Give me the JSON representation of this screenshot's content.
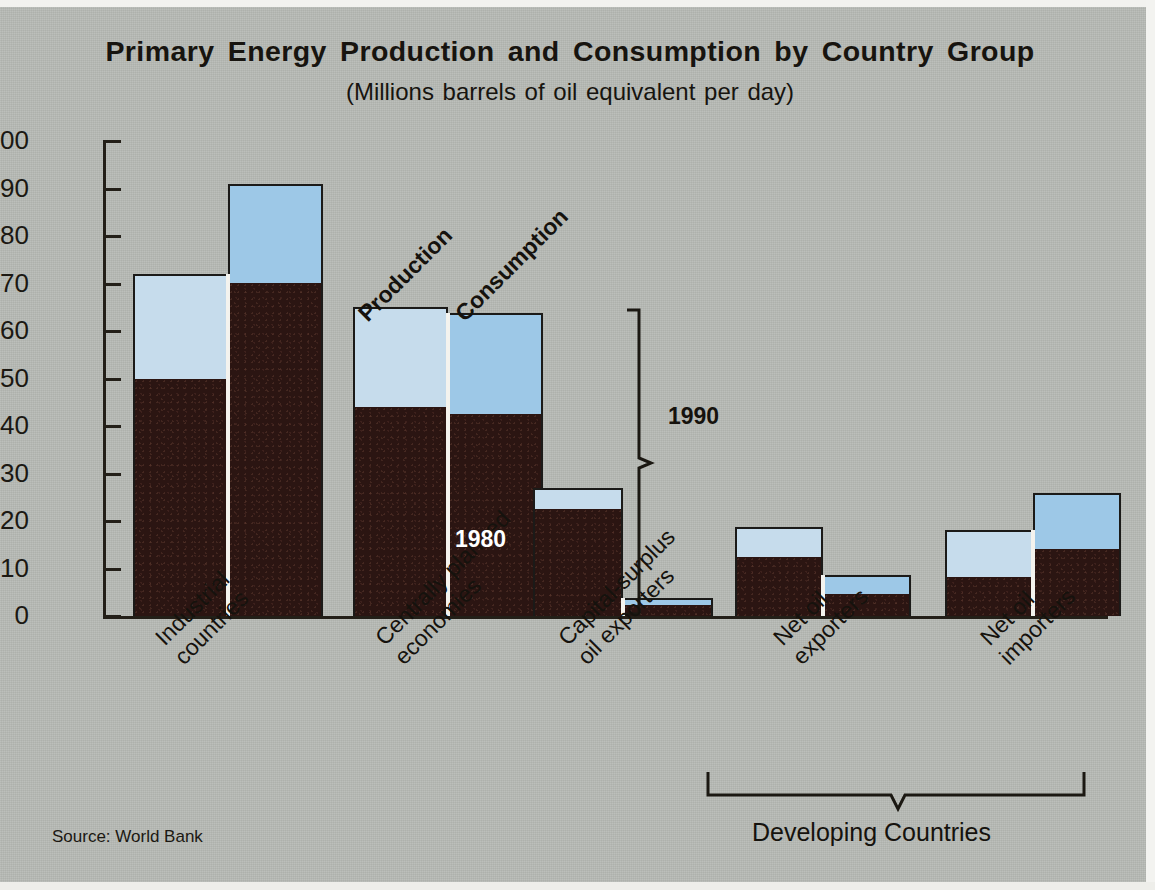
{
  "figure": {
    "title": "Primary Energy Production and Consumption by Country Group",
    "subtitle": "(Millions barrels of oil equivalent per day)",
    "source": "Source: World Bank",
    "background_color": "#b7bab5",
    "production_color": "#c6dcec",
    "consumption_color": "#9dc8e7",
    "base_segment_color": "#2b1512",
    "outline_color": "#1b1a18"
  },
  "annotations": {
    "series_label_production": "Production",
    "series_label_consumption": "Consumption",
    "bracket_label_upper": "1990",
    "bracket_label_lower": "1980",
    "group_bracket_label": "Developing Countries"
  },
  "chart_data": {
    "type": "bar",
    "title": "Primary Energy Production and Consumption by Country Group",
    "subtitle": "(Millions barrels of oil equivalent per day)",
    "xlabel": "",
    "ylabel": "Millions barrels of oil equivalent per day",
    "ylim": [
      0,
      100
    ],
    "yticks": [
      0,
      10,
      20,
      30,
      40,
      50,
      60,
      70,
      80,
      90,
      100
    ],
    "ytick_labels": [
      "0",
      "10",
      "20",
      "30",
      "40",
      "50",
      "60",
      "70",
      "80",
      "90",
      "100"
    ],
    "grid": false,
    "legend_position": "inline-diagonal",
    "stacked": true,
    "stack_levels": [
      "1980",
      "1990"
    ],
    "categories": [
      "Industrial countries",
      "Centrally planned economies",
      "Capital-surplus oil exporters",
      "Net oil exporters",
      "Net oil importers"
    ],
    "category_label_lines": [
      [
        "Industrial",
        "countries"
      ],
      [
        "Centrally planned",
        "economies"
      ],
      [
        "Capital-surplus",
        "oil exporters"
      ],
      [
        "Net oil",
        "exporters"
      ],
      [
        "Net oil",
        "importers"
      ]
    ],
    "series": [
      {
        "name": "Production",
        "values_1980": [
          50.0,
          44.0,
          22.5,
          12.5,
          8.2
        ],
        "values_1990": [
          72.0,
          65.0,
          27.0,
          18.7,
          18.1
        ]
      },
      {
        "name": "Consumption",
        "values_1980": [
          70.2,
          42.5,
          2.3,
          4.7,
          14.2
        ],
        "values_1990": [
          91.0,
          63.8,
          3.8,
          8.7,
          25.9
        ]
      }
    ],
    "developing_countries_group": [
      "Net oil exporters",
      "Net oil importers"
    ]
  },
  "yticks_render": [
    {
      "label": "100",
      "value": 100
    },
    {
      "label": "90",
      "value": 90
    },
    {
      "label": "80",
      "value": 80
    },
    {
      "label": "70",
      "value": 70
    },
    {
      "label": "60",
      "value": 60
    },
    {
      "label": "50",
      "value": 50
    },
    {
      "label": "40",
      "value": 40
    },
    {
      "label": "30",
      "value": 30
    },
    {
      "label": "20",
      "value": 20
    },
    {
      "label": "10",
      "value": 10
    },
    {
      "label": "0",
      "value": 0
    }
  ],
  "bars_render": [
    {
      "group": "Industrial countries",
      "series": "Production",
      "left": 30,
      "width": 95,
      "total": 72.0,
      "base": 50.0
    },
    {
      "group": "Industrial countries",
      "series": "Consumption",
      "left": 125,
      "width": 95,
      "total": 91.0,
      "base": 70.2
    },
    {
      "group": "Centrally planned economies",
      "series": "Production",
      "left": 250,
      "width": 95,
      "total": 65.0,
      "base": 44.0
    },
    {
      "group": "Centrally planned economies",
      "series": "Consumption",
      "left": 345,
      "width": 95,
      "total": 63.8,
      "base": 42.5
    },
    {
      "group": "Capital-surplus oil exporters",
      "series": "Production",
      "left": 430,
      "width": 90,
      "total": 27.0,
      "base": 22.5
    },
    {
      "group": "Capital-surplus oil exporters",
      "series": "Consumption",
      "left": 520,
      "width": 90,
      "total": 3.8,
      "base": 2.3
    },
    {
      "group": "Net oil exporters",
      "series": "Production",
      "left": 632,
      "width": 88,
      "total": 18.7,
      "base": 12.5
    },
    {
      "group": "Net oil exporters",
      "series": "Consumption",
      "left": 720,
      "width": 88,
      "total": 8.7,
      "base": 4.7
    },
    {
      "group": "Net oil importers",
      "series": "Production",
      "left": 842,
      "width": 88,
      "total": 18.1,
      "base": 8.2
    },
    {
      "group": "Net oil importers",
      "series": "Consumption",
      "left": 930,
      "width": 88,
      "total": 25.9,
      "base": 14.2
    }
  ],
  "category_labels_render": [
    {
      "l1": "Industrial",
      "l2": "countries",
      "left": 150,
      "top": 632
    },
    {
      "l1": "Centrally planned",
      "l2": "economies",
      "left": 370,
      "top": 632
    },
    {
      "l1": "Capital-surplus",
      "l2": "oil exporters",
      "left": 553,
      "top": 632
    },
    {
      "l1": "Net oil",
      "l2": "exporters",
      "left": 768,
      "top": 632
    },
    {
      "l1": "Net oil",
      "l2": "importers",
      "left": 975,
      "top": 632
    }
  ]
}
